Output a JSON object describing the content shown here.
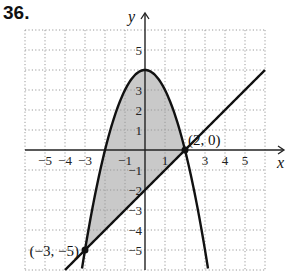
{
  "problem": {
    "number": "36."
  },
  "chart_data": {
    "type": "line",
    "title": "",
    "xlabel": "x",
    "ylabel": "y",
    "xlim": [
      -6,
      6
    ],
    "ylim": [
      -6,
      6
    ],
    "grid": true,
    "x_tick_labels": [
      {
        "value": -5,
        "text": "−5"
      },
      {
        "value": -4,
        "text": "−4"
      },
      {
        "value": -3,
        "text": "−3"
      },
      {
        "value": -1,
        "text": "−1"
      },
      {
        "value": 1,
        "text": "1"
      },
      {
        "value": 3,
        "text": "3"
      },
      {
        "value": 4,
        "text": "4"
      },
      {
        "value": 5,
        "text": "5"
      }
    ],
    "y_tick_labels": [
      {
        "value": 5,
        "text": "5"
      },
      {
        "value": 3,
        "text": "3"
      },
      {
        "value": 2,
        "text": "2"
      },
      {
        "value": 1,
        "text": "1"
      },
      {
        "value": -1,
        "text": "−1"
      },
      {
        "value": -2,
        "text": "−2"
      },
      {
        "value": -3,
        "text": "−3"
      },
      {
        "value": -4,
        "text": "−4"
      },
      {
        "value": -5,
        "text": "−5"
      }
    ],
    "series": [
      {
        "name": "parabola",
        "equation": "y = 4 - x^2",
        "x_range": [
          -3.15,
          3.15
        ]
      },
      {
        "name": "line",
        "equation": "y = x - 2",
        "x_range": [
          -4,
          6
        ]
      }
    ],
    "shaded_region": {
      "between": [
        "parabola",
        "line"
      ],
      "x_range": [
        -3,
        2
      ],
      "color": "#c9c9c9"
    },
    "points": [
      {
        "x": 2,
        "y": 0,
        "label": "(2, 0)"
      },
      {
        "x": -3,
        "y": -5,
        "label": "(−3, −5)"
      }
    ]
  }
}
